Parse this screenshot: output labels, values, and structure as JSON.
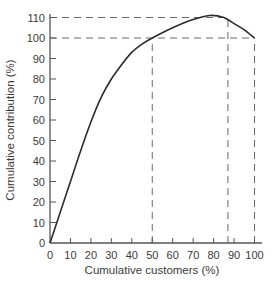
{
  "chart_data": {
    "type": "line",
    "title": "",
    "xlabel": "Cumulative customers (%)",
    "ylabel": "Cumulative contribution (%)",
    "xlim": [
      0,
      100
    ],
    "ylim": [
      0,
      110
    ],
    "x_ticks": [
      0,
      10,
      20,
      30,
      40,
      50,
      60,
      70,
      80,
      90,
      100
    ],
    "y_ticks": [
      0,
      10,
      20,
      30,
      40,
      50,
      60,
      70,
      80,
      90,
      100,
      110
    ],
    "grid": false,
    "legend": null,
    "series": [
      {
        "name": "Cumulative contribution",
        "x": [
          0,
          5,
          10,
          15,
          20,
          25,
          30,
          35,
          40,
          45,
          50,
          60,
          70,
          78,
          85,
          90,
          95,
          100
        ],
        "y": [
          0,
          15,
          30,
          45,
          59,
          71,
          80,
          87,
          93,
          97,
          100,
          105,
          109,
          111,
          110,
          107,
          104,
          100
        ]
      }
    ],
    "reference_lines": [
      {
        "type": "horizontal",
        "y": 110,
        "x_from": 0,
        "x_to": 87,
        "style": "dashed"
      },
      {
        "type": "horizontal",
        "y": 100,
        "x_from": 0,
        "x_to": 100,
        "style": "dashed"
      },
      {
        "type": "vertical",
        "x": 50,
        "y_from": 0,
        "y_to": 100,
        "style": "dashed"
      },
      {
        "type": "vertical",
        "x": 87,
        "y_from": 0,
        "y_to": 110,
        "style": "dashed"
      },
      {
        "type": "vertical",
        "x": 100,
        "y_from": 0,
        "y_to": 100,
        "style": "dashed"
      }
    ]
  },
  "colors": {
    "axis": "#555555",
    "curve": "#2b2b2b",
    "dash": "#6a6a6a",
    "text": "#3a3a3a"
  }
}
